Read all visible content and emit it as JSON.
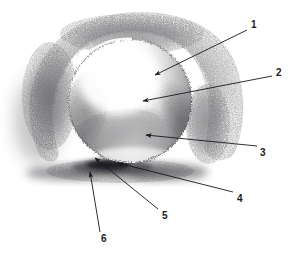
{
  "figure": {
    "kind": "pencil-drawing",
    "medium": "graphite pencil on white paper",
    "background_color": "#ffffff",
    "ink_color": "#19191b",
    "graphite_color": "#4a4a4d"
  },
  "annotations": [
    {
      "id": "callout-1",
      "label": "1",
      "label_x": 251,
      "label_y": 20,
      "leader": {
        "x1": 247,
        "y1": 30,
        "x2": 155,
        "y2": 75
      },
      "arrow_at": "tip"
    },
    {
      "id": "callout-2",
      "label": "2",
      "label_x": 276,
      "label_y": 68,
      "leader": {
        "x1": 272,
        "y1": 76,
        "x2": 143,
        "y2": 101
      },
      "arrow_at": "tip"
    },
    {
      "id": "callout-3",
      "label": "3",
      "label_x": 260,
      "label_y": 148,
      "leader": {
        "x1": 257,
        "y1": 146,
        "x2": 146,
        "y2": 135
      },
      "arrow_at": "tip"
    },
    {
      "id": "callout-4",
      "label": "4",
      "label_x": 237,
      "label_y": 194,
      "leader": {
        "x1": 233,
        "y1": 192,
        "x2": 118,
        "y2": 163
      },
      "arrow_at": "tip"
    },
    {
      "id": "callout-5",
      "label": "5",
      "label_x": 162,
      "label_y": 211,
      "leader": {
        "x1": 158,
        "y1": 209,
        "x2": 95,
        "y2": 158
      },
      "arrow_at": "tip"
    },
    {
      "id": "callout-6",
      "label": "6",
      "label_x": 101,
      "label_y": 234,
      "leader": {
        "x1": 100,
        "y1": 232,
        "x2": 90,
        "y2": 172
      },
      "arrow_at": "tip"
    }
  ],
  "sphere": {
    "center_x": 130,
    "center_y": 101,
    "radius": 62,
    "highlight_x": 118,
    "highlight_y": 82
  },
  "cast_shadow": {
    "center_x": 118,
    "center_y": 172,
    "width": 150,
    "height": 22
  },
  "background_shading": {
    "description": "crescent of dark hatching behind and around the sphere"
  }
}
